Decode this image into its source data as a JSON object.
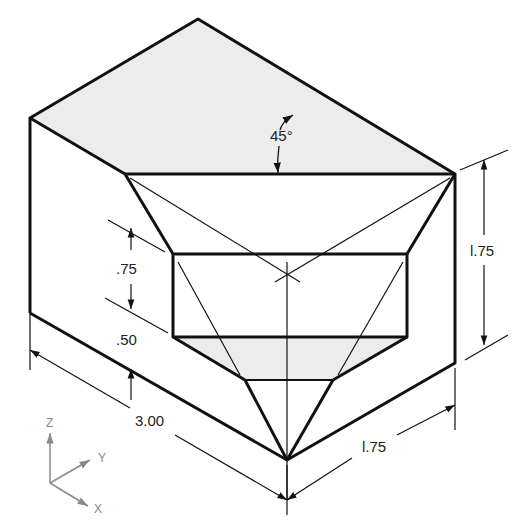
{
  "figure": {
    "dimensions": {
      "angle": "45°",
      "height_right": "l.75",
      "notch_depth": ".75",
      "notch_offset": ".50",
      "length": "3.00",
      "width": "l.75"
    },
    "axes": {
      "z": "Z",
      "y": "Y",
      "x": "X"
    },
    "colors": {
      "line": "#111111",
      "shade": "#ececec",
      "axis": "#8a8a8a"
    }
  }
}
